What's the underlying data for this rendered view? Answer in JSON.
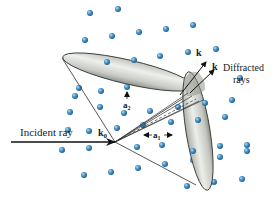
{
  "figure": {
    "type": "Laue diffraction cone diagram",
    "labels": {
      "incident_ray": "Incident ray",
      "k0": "k",
      "k0_sub": "0",
      "k_upper": "k",
      "k_lower": "k",
      "diffracted_line1": "Diffracted",
      "diffracted_line2": "rays",
      "a1": "a",
      "a1_sub": "1",
      "a2": "a",
      "a2_sub": "2"
    },
    "colors": {
      "atom": "#3f8fc6",
      "atom_highlight": "#a8d4f0",
      "cone_fill": "#d6d8d4",
      "cone_shade": "#9ea29c",
      "line": "#333333"
    },
    "atoms": [
      [
        90,
        13
      ],
      [
        118,
        9
      ],
      [
        85,
        40
      ],
      [
        112,
        36
      ],
      [
        139,
        32
      ],
      [
        166,
        29
      ],
      [
        193,
        25
      ],
      [
        188,
        52
      ],
      [
        216,
        49
      ],
      [
        107,
        62
      ],
      [
        134,
        60
      ],
      [
        160,
        56
      ],
      [
        79,
        88
      ],
      [
        75,
        96
      ],
      [
        101,
        91
      ],
      [
        127,
        87
      ],
      [
        155,
        82
      ],
      [
        240,
        78
      ],
      [
        70,
        112
      ],
      [
        100,
        107
      ],
      [
        124,
        113
      ],
      [
        150,
        111
      ],
      [
        178,
        107
      ],
      [
        205,
        103
      ],
      [
        232,
        100
      ],
      [
        68,
        130
      ],
      [
        89,
        131
      ],
      [
        117,
        128
      ],
      [
        143,
        125
      ],
      [
        171,
        122
      ],
      [
        198,
        120
      ],
      [
        225,
        117
      ],
      [
        62,
        150
      ],
      [
        89,
        148
      ],
      [
        137,
        147
      ],
      [
        162,
        145
      ],
      [
        193,
        151
      ],
      [
        220,
        146
      ],
      [
        247,
        145
      ],
      [
        84,
        175
      ],
      [
        111,
        172
      ],
      [
        138,
        168
      ],
      [
        165,
        164
      ],
      [
        193,
        160
      ],
      [
        220,
        157
      ],
      [
        247,
        151
      ],
      [
        187,
        186
      ],
      [
        214,
        182
      ],
      [
        242,
        179
      ]
    ]
  }
}
